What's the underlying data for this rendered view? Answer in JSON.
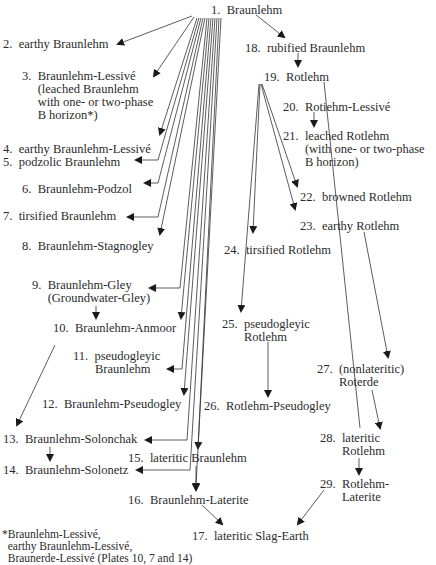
{
  "diagram": {
    "nodes": [
      {
        "id": 1,
        "label": "1.  Braunlehm",
        "x": 211,
        "y": 4
      },
      {
        "id": 2,
        "label": "2.  earthy Braunlehm",
        "x": 3,
        "y": 38
      },
      {
        "id": 3,
        "label": "3.  Braunlehm-Lessivé\n     (leached Braunlehm\n     with one- or two-phase\n     B horizon*)",
        "x": 22,
        "y": 70
      },
      {
        "id": 4,
        "label": "4.  earthy Braunlehm-Lessivé",
        "x": 3,
        "y": 143
      },
      {
        "id": 5,
        "label": "5.  podzolic Braunlehm",
        "x": 3,
        "y": 156
      },
      {
        "id": 6,
        "label": "6.  Braunlehm-Podzol",
        "x": 22,
        "y": 183
      },
      {
        "id": 7,
        "label": "7.  tirsified Braunlehm",
        "x": 3,
        "y": 210
      },
      {
        "id": 8,
        "label": "8.  Braunlehm-Stagnogley",
        "x": 22,
        "y": 240
      },
      {
        "id": 9,
        "label": "9.  Braunlehm-Gley\n     (Groundwater-Gley)",
        "x": 32,
        "y": 279
      },
      {
        "id": 10,
        "label": "10.  Braunlehm-Anmoor",
        "x": 53,
        "y": 322
      },
      {
        "id": 11,
        "label": "11.  pseudogleyic\n       Braunlehm",
        "x": 73,
        "y": 350
      },
      {
        "id": 12,
        "label": "12.  Braunlehm-Pseudogley",
        "x": 42,
        "y": 398
      },
      {
        "id": 13,
        "label": "13.  Braunlehm-Solonchak",
        "x": 3,
        "y": 433
      },
      {
        "id": 14,
        "label": "14.  Braunlehm-Solonetz",
        "x": 3,
        "y": 464
      },
      {
        "id": 15,
        "label": "15.  lateritic Braunlehm",
        "x": 128,
        "y": 452
      },
      {
        "id": 16,
        "label": "16.  Braunlehm-Laterite",
        "x": 128,
        "y": 494
      },
      {
        "id": 17,
        "label": "17.  lateritic Slag-Earth",
        "x": 192,
        "y": 530
      },
      {
        "id": 18,
        "label": "18.  rubified Braunlehm",
        "x": 245,
        "y": 42
      },
      {
        "id": 19,
        "label": "19.  Rotlehm",
        "x": 264,
        "y": 71
      },
      {
        "id": 20,
        "label": "20.  Rotiehm-Lessivé",
        "x": 283,
        "y": 101
      },
      {
        "id": 21,
        "label": "21.  leached Rotlehm\n       (with one- or two-phase\n       B horizon)",
        "x": 283,
        "y": 130
      },
      {
        "id": 22,
        "label": "22.  browned Rotlehm",
        "x": 300,
        "y": 191
      },
      {
        "id": 23,
        "label": "23.  earthy Rotlehm",
        "x": 300,
        "y": 220
      },
      {
        "id": 24,
        "label": "24.  tirsified Rotlehm",
        "x": 224,
        "y": 244
      },
      {
        "id": 25,
        "label": "25.  pseudogleyic\n       Rotlehm",
        "x": 222,
        "y": 318
      },
      {
        "id": 26,
        "label": "26.  Rotlehm-Pseudogley",
        "x": 204,
        "y": 400
      },
      {
        "id": 27,
        "label": "27.  (nonlateritic)\n       Roterde",
        "x": 317,
        "y": 363
      },
      {
        "id": 28,
        "label": "28.  lateritic\n       Rotlehm",
        "x": 320,
        "y": 432
      },
      {
        "id": 29,
        "label": "29.  Rotlehm-\n       Laterite",
        "x": 320,
        "y": 478
      }
    ],
    "footnote": "*Braunlehm-Lessivé,\n  earthy Braunlehm-Lessivé,\n  Braunerde-Lessivé (Plates 10, 7 and 14)"
  }
}
